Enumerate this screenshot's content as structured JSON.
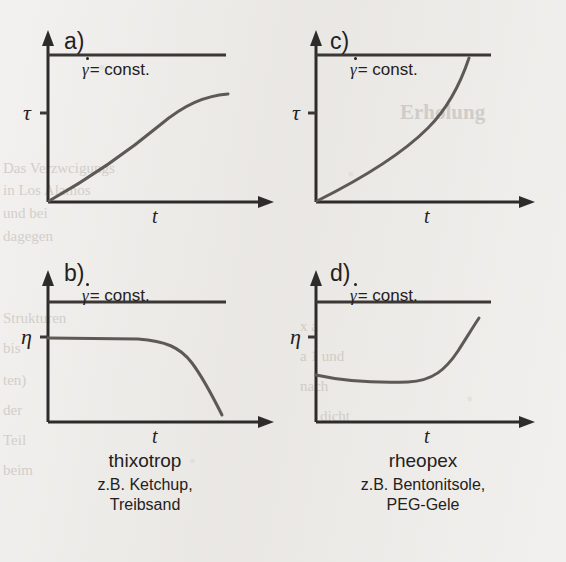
{
  "figure": {
    "background_color": "#eceae7",
    "ink_color": "#2e2c2a",
    "curve_color": "#5d5a56"
  },
  "panels": [
    {
      "id": "a",
      "letter": "a)",
      "y_axis_label": "τ",
      "x_axis_label": "t",
      "const_gamma": "γ",
      "const_rest": "= const.",
      "caption_note": "shear stress rises and saturates (thixotropic build-down)"
    },
    {
      "id": "c",
      "letter": "c)",
      "y_axis_label": "τ",
      "x_axis_label": "t",
      "const_gamma": "γ",
      "const_rest": "= const.",
      "caption_note": "shear stress rises progressively (rheopectic build-up)"
    },
    {
      "id": "b",
      "letter": "b)",
      "y_axis_label": "η",
      "x_axis_label": "t",
      "const_gamma": "γ",
      "const_rest": "= const.",
      "caption_note": "viscosity plateau then decays"
    },
    {
      "id": "d",
      "letter": "d)",
      "y_axis_label": "η",
      "x_axis_label": "t",
      "const_gamma": "γ",
      "const_rest": "= const.",
      "caption_note": "viscosity plateau then increases"
    }
  ],
  "captions": {
    "left": {
      "title": "thixotrop",
      "examples_line1": "z.B. Ketchup,",
      "examples_line2": "Treibsand"
    },
    "right": {
      "title": "rheopex",
      "examples_line1": "z.B. Bentonitsole,",
      "examples_line2": "PEG-Gele"
    }
  },
  "bleed_through": [
    {
      "text": "Erholung",
      "x": 400,
      "y": 100,
      "size": "big"
    },
    {
      "text": "Das Verzwcigungs",
      "x": 3,
      "y": 160,
      "size": "norm"
    },
    {
      "text": "in Los Alamos",
      "x": 3,
      "y": 182,
      "size": "norm"
    },
    {
      "text": "und bei",
      "x": 3,
      "y": 205,
      "size": "norm"
    },
    {
      "text": "dagegen",
      "x": 3,
      "y": 228,
      "size": "norm"
    },
    {
      "text": "Strukturen",
      "x": 3,
      "y": 310,
      "size": "norm"
    },
    {
      "text": "bis",
      "x": 3,
      "y": 340,
      "size": "norm"
    },
    {
      "text": "ten)",
      "x": 3,
      "y": 372,
      "size": "norm"
    },
    {
      "text": "der",
      "x": 3,
      "y": 402,
      "size": "norm"
    },
    {
      "text": "Teil",
      "x": 3,
      "y": 432,
      "size": "norm"
    },
    {
      "text": "beim",
      "x": 3,
      "y": 462,
      "size": "norm"
    },
    {
      "text": "x a",
      "x": 300,
      "y": 318,
      "size": "norm"
    },
    {
      "text": "a 1 und",
      "x": 300,
      "y": 348,
      "size": "norm"
    },
    {
      "text": "nach",
      "x": 300,
      "y": 378,
      "size": "norm"
    },
    {
      "text": "dicht",
      "x": 320,
      "y": 408,
      "size": "norm"
    }
  ]
}
